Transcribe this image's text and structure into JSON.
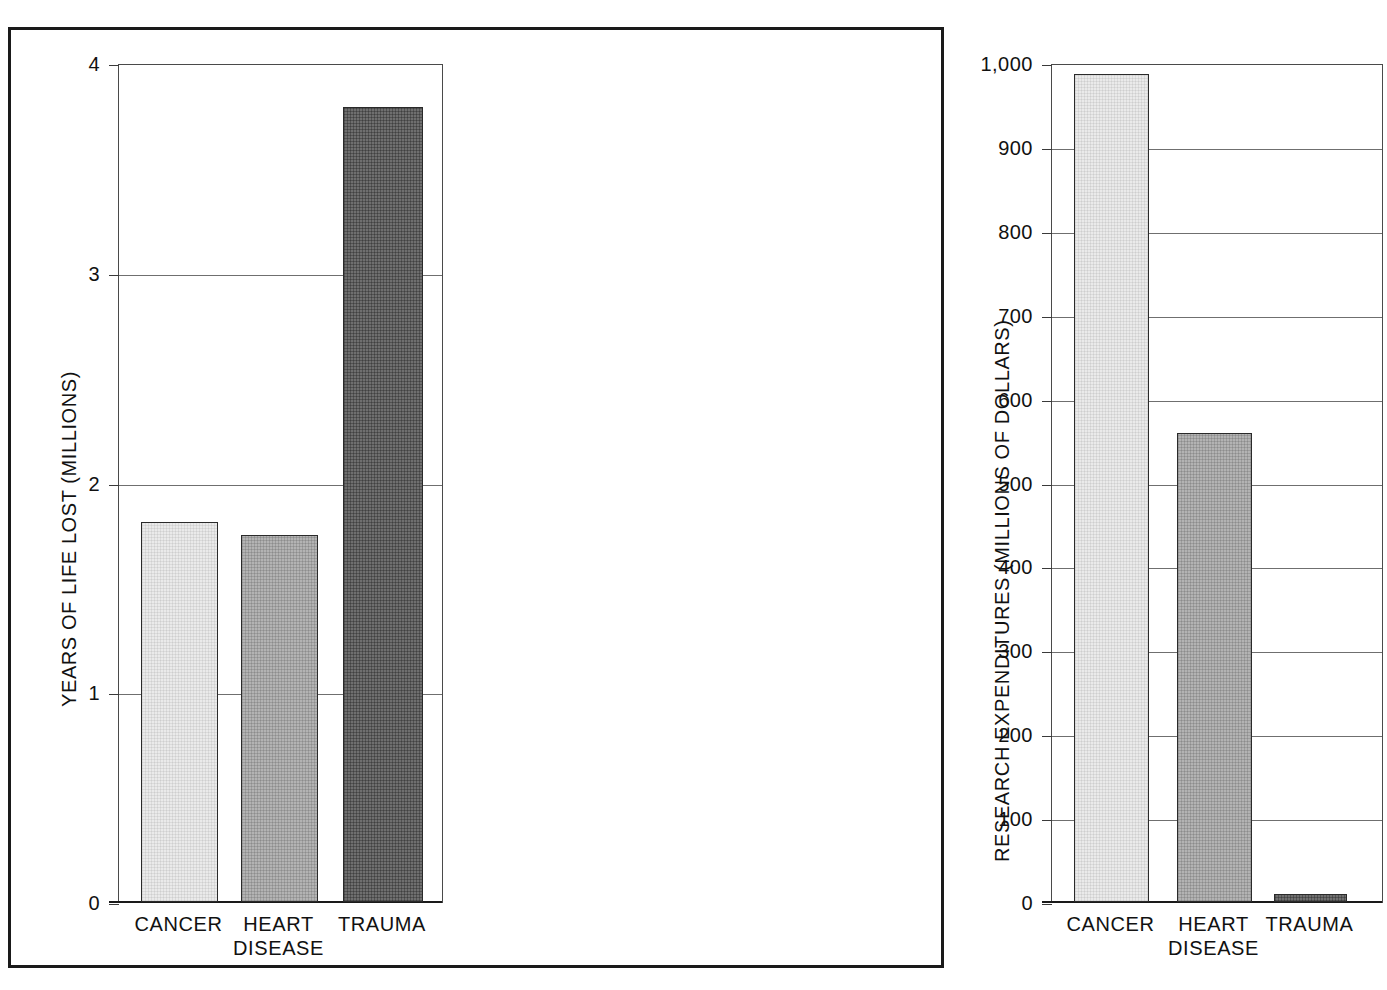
{
  "figure": {
    "background_color": "#ffffff",
    "frame_color": "#1a1a1a"
  },
  "chart_data": [
    {
      "type": "bar",
      "panel": "left",
      "title": "",
      "xlabel": "",
      "ylabel": "YEARS OF LIFE LOST (MILLIONS)",
      "categories": [
        "CANCER",
        "HEART\nDISEASE",
        "TRAUMA"
      ],
      "values": [
        1.81,
        1.75,
        3.79
      ],
      "ylim": [
        0,
        4
      ],
      "yticks": [
        0,
        1,
        2,
        3,
        4
      ],
      "ytick_labels": [
        "0",
        "1",
        "2",
        "3",
        "4"
      ],
      "grid": true,
      "legend": "none",
      "bar_colors": [
        "#eaeaea",
        "#b3b3b3",
        "#6f6f6f"
      ]
    },
    {
      "type": "bar",
      "panel": "right",
      "title": "",
      "xlabel": "",
      "ylabel": "RESEARCH EXPENDITURES (MILLIONS OF DOLLARS)",
      "categories": [
        "CANCER",
        "HEART\nDISEASE",
        "TRAUMA"
      ],
      "values": [
        987,
        559,
        10
      ],
      "ylim": [
        0,
        1000
      ],
      "yticks": [
        0,
        100,
        200,
        300,
        400,
        500,
        600,
        700,
        800,
        900,
        1000
      ],
      "ytick_labels": [
        "0",
        "100",
        "200",
        "300",
        "400",
        "500",
        "600",
        "700",
        "800",
        "900",
        "1,000"
      ],
      "grid": true,
      "legend": "none",
      "bar_colors": [
        "#eaeaea",
        "#b3b3b3",
        "#6f6f6f"
      ]
    }
  ]
}
